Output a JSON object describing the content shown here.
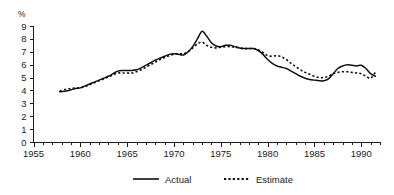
{
  "chart_data": {
    "type": "line",
    "title": "",
    "xlabel": "",
    "ylabel": "%",
    "unit_label": "%",
    "xlim": [
      1955,
      1992
    ],
    "ylim": [
      0,
      9
    ],
    "grid": false,
    "legend_position": "bottom",
    "y_ticks": [
      "0",
      "1",
      "2",
      "3",
      "4",
      "5",
      "6",
      "7",
      "8",
      "9"
    ],
    "y_tick_values": [
      0,
      1,
      2,
      3,
      4,
      5,
      6,
      7,
      8,
      9
    ],
    "x_ticks": [
      "1955",
      "1960",
      "1965",
      "1970",
      "1975",
      "1980",
      "1985",
      "1990"
    ],
    "x_tick_values": [
      1955,
      1960,
      1965,
      1970,
      1975,
      1980,
      1985,
      1990
    ],
    "x_minor_step": 1,
    "x": [
      1957.8,
      1958.5,
      1959,
      1959.5,
      1960,
      1960.5,
      1961,
      1961.5,
      1962,
      1962.5,
      1963,
      1963.5,
      1964,
      1964.5,
      1965,
      1965.5,
      1966,
      1966.5,
      1967,
      1967.5,
      1968,
      1968.5,
      1969,
      1969.5,
      1970,
      1970.5,
      1971,
      1971.5,
      1972,
      1972.5,
      1973,
      1973.5,
      1974,
      1974.5,
      1975,
      1975.5,
      1976,
      1976.5,
      1977,
      1977.5,
      1978,
      1978.5,
      1979,
      1979.5,
      1980,
      1980.5,
      1981,
      1981.5,
      1982,
      1982.5,
      1983,
      1983.5,
      1984,
      1984.5,
      1985,
      1985.5,
      1986,
      1986.5,
      1987,
      1987.5,
      1988,
      1988.5,
      1989,
      1989.5,
      1990,
      1990.5,
      1991,
      1991.5
    ],
    "series": [
      {
        "name": "Actual",
        "style": "solid",
        "values": [
          3.9,
          3.95,
          4.05,
          4.15,
          4.2,
          4.35,
          4.5,
          4.65,
          4.8,
          4.95,
          5.1,
          5.3,
          5.5,
          5.55,
          5.55,
          5.55,
          5.6,
          5.75,
          5.95,
          6.15,
          6.35,
          6.5,
          6.65,
          6.8,
          6.85,
          6.8,
          6.75,
          7.0,
          7.4,
          8.0,
          8.6,
          8.2,
          7.7,
          7.45,
          7.4,
          7.5,
          7.5,
          7.4,
          7.3,
          7.25,
          7.25,
          7.25,
          7.1,
          6.8,
          6.4,
          6.1,
          5.9,
          5.8,
          5.7,
          5.5,
          5.3,
          5.1,
          4.95,
          4.85,
          4.8,
          4.75,
          4.75,
          4.9,
          5.3,
          5.7,
          5.9,
          6.0,
          5.95,
          5.9,
          5.95,
          5.7,
          5.3,
          5.1
        ],
        "points": 68
      },
      {
        "name": "Estimate",
        "style": "dotted",
        "values": [
          3.95,
          4.1,
          4.15,
          4.2,
          4.2,
          4.3,
          4.45,
          4.6,
          4.75,
          4.9,
          5.05,
          5.2,
          5.35,
          5.35,
          5.35,
          5.35,
          5.45,
          5.6,
          5.8,
          6.0,
          6.2,
          6.4,
          6.55,
          6.7,
          6.8,
          6.85,
          6.85,
          7.0,
          7.3,
          7.6,
          7.75,
          7.5,
          7.35,
          7.3,
          7.35,
          7.4,
          7.4,
          7.35,
          7.3,
          7.25,
          7.25,
          7.25,
          7.15,
          6.95,
          6.7,
          6.65,
          6.7,
          6.6,
          6.4,
          6.1,
          5.85,
          5.6,
          5.4,
          5.25,
          5.1,
          5.0,
          5.0,
          5.1,
          5.3,
          5.4,
          5.45,
          5.45,
          5.4,
          5.35,
          5.3,
          5.1,
          4.95,
          5.4
        ],
        "points": 68
      }
    ],
    "legend": [
      {
        "label": "Actual",
        "style": "solid"
      },
      {
        "label": "Estimate",
        "style": "dotted"
      }
    ]
  }
}
